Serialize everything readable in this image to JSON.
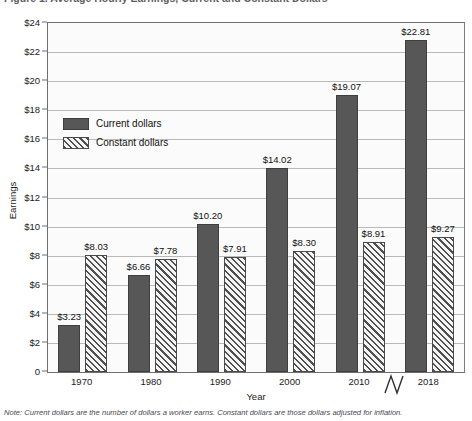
{
  "figure": {
    "title": "Figure 1. Average Hourly Earnings, Current and Constant Dollars",
    "note": "Note: Current dollars are the number of dollars a worker earns. Constant dollars are those dollars adjusted for inflation."
  },
  "legend": {
    "position": "inside-upper-left",
    "entries": [
      {
        "label": "Current dollars",
        "swatch": "solid-dark-gray",
        "color": "#575757"
      },
      {
        "label": "Constant dollars",
        "swatch": "diagonal-hatch",
        "color": "#4f4f4f"
      }
    ]
  },
  "axis_break": {
    "present": true,
    "between": [
      "2010",
      "2018"
    ],
    "symbol": "zigzag"
  },
  "chart_data": {
    "type": "bar",
    "title": "Figure 1. Average Hourly Earnings, Current and Constant Dollars",
    "xlabel": "Year",
    "ylabel": "Earnings",
    "categories": [
      "1970",
      "1980",
      "1990",
      "2000",
      "2010",
      "2018"
    ],
    "series": [
      {
        "name": "Current dollars",
        "values": [
          3.23,
          6.66,
          10.2,
          14.02,
          19.07,
          22.81
        ]
      },
      {
        "name": "Constant dollars",
        "values": [
          8.03,
          7.78,
          7.91,
          8.3,
          8.91,
          9.27
        ]
      }
    ],
    "data_labels": {
      "Current dollars": [
        "$3.23",
        "$6.66",
        "$10.20",
        "$14.02",
        "$19.07",
        "$22.81"
      ],
      "Constant dollars": [
        "$8.03",
        "$7.78",
        "$7.91",
        "$8.30",
        "$8.91",
        "$9.27"
      ]
    },
    "ylim": [
      0,
      24
    ],
    "yticks": [
      0,
      2,
      4,
      6,
      8,
      10,
      12,
      14,
      16,
      18,
      20,
      22,
      24
    ],
    "ytick_labels": [
      "0",
      "$2",
      "$4",
      "$6",
      "$8",
      "$10",
      "$12",
      "$14",
      "$16",
      "$18",
      "$20",
      "$22",
      "$24"
    ],
    "grid": "horizontal",
    "legend_position": "inside-upper-left"
  }
}
